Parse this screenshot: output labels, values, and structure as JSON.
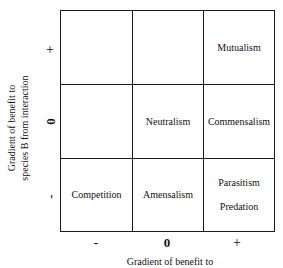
{
  "diagram": {
    "type": "interaction-matrix",
    "y_axis": {
      "label_lines": [
        "Gradient of benefit to",
        "species B from interaction"
      ],
      "ticks": [
        "+",
        "0",
        "-"
      ]
    },
    "x_axis": {
      "label_visible": "Gradient of benefit to",
      "ticks": [
        "-",
        "0",
        "+"
      ]
    },
    "cells": {
      "row_plus": {
        "col_minus": "",
        "col_zero": "",
        "col_plus": "Mutualism"
      },
      "row_zero": {
        "col_minus": "",
        "col_zero": "Neutralism",
        "col_plus": "Commensalism"
      },
      "row_minus": {
        "col_minus": "Competition",
        "col_zero": "Amensalism",
        "col_plus": [
          "Parasitism",
          "Predation"
        ]
      }
    }
  }
}
